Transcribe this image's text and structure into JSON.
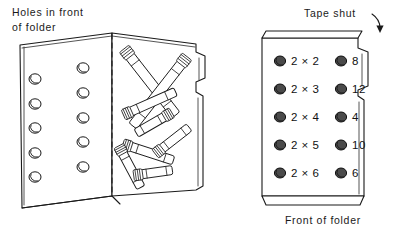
{
  "figure": {
    "title_left": {
      "line1": "Holes in front",
      "line2": "of folder"
    },
    "label_tape": "Tape shut",
    "caption_front": "Front of folder"
  },
  "left_panel": {
    "name": "open-folder-with-clothespins",
    "hole_columns": 2,
    "holes_per_column": 5,
    "clothespin_count": 8
  },
  "right_panel": {
    "name": "closed-folder-front",
    "rows": [
      {
        "problem": "2 × 2",
        "answer": "8"
      },
      {
        "problem": "2 × 3",
        "answer": "12"
      },
      {
        "problem": "2 × 4",
        "answer": "4"
      },
      {
        "problem": "2 × 5",
        "answer": "10"
      },
      {
        "problem": "2 × 6",
        "answer": "6"
      }
    ]
  },
  "colors": {
    "ink": "#1a1a1a",
    "paper": "#ffffff",
    "hole_fill": "#4a4a4a"
  }
}
